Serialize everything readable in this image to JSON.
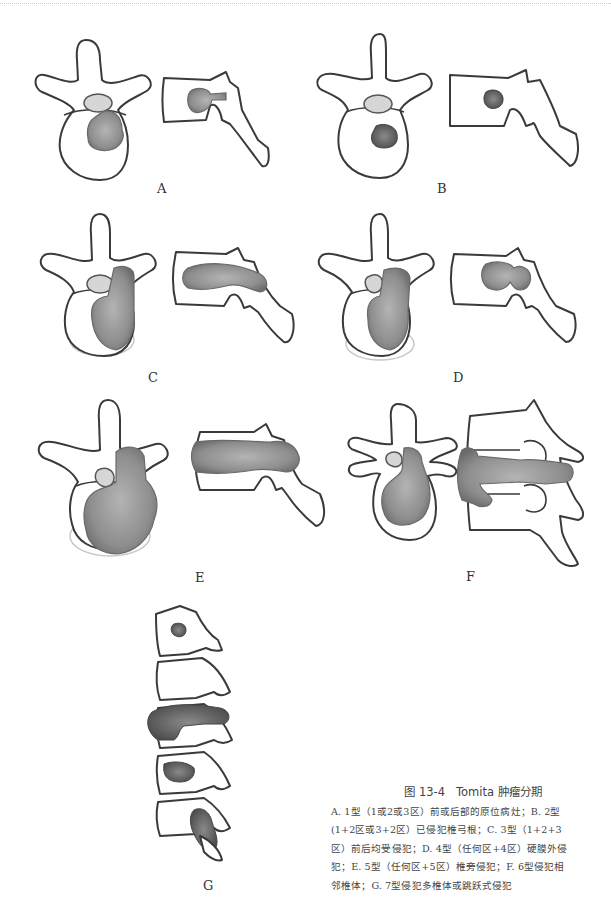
{
  "figure": {
    "number": "图 13-4",
    "title": "Tomita 肿瘤分期",
    "panels": [
      {
        "id": "A",
        "label": "A"
      },
      {
        "id": "B",
        "label": "B"
      },
      {
        "id": "C",
        "label": "C"
      },
      {
        "id": "D",
        "label": "D"
      },
      {
        "id": "E",
        "label": "E"
      },
      {
        "id": "F",
        "label": "F"
      },
      {
        "id": "G",
        "label": "G"
      }
    ],
    "caption_lines": [
      "A. 1型（1或2或3区）前或后部的原位病灶；B. 2型",
      "(1+2区或3+2区）已侵犯椎弓根；C. 3型（1+2+3",
      "区）前后均受侵犯；D. 4型（任何区+4区）硬膜外侵",
      "犯；E. 5型（任何区+5区）椎旁侵犯；F. 6型侵犯相",
      "邻椎体；G. 7型侵犯多椎体或跳跃式侵犯"
    ]
  },
  "colors": {
    "outline": "#3a3a3a",
    "tumor": "#8c8c8c",
    "background": "#ffffff"
  }
}
